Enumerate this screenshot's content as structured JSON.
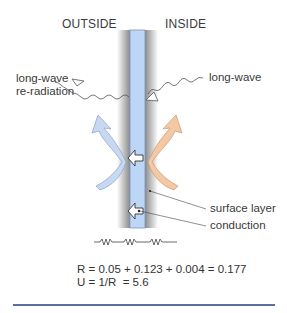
{
  "labels": {
    "outside": "OUTSIDE",
    "inside": "INSIDE",
    "long_wave_left_line1": "long-wave",
    "long_wave_left_line2": "re-radiation",
    "long_wave_right": "long-wave",
    "surface_layer": "surface layer",
    "conduction": "conduction"
  },
  "equations": {
    "resistance": "R = 0.05 + 0.123 + 0.004 = 0.177",
    "u_value": "U = 1/R  = 5.6"
  },
  "colors": {
    "glass": "#bcd6f5",
    "glass_edge": "#7c95b8",
    "frame_gray": "#8a8a8a",
    "cold_arrow": "#c7d8f2",
    "warm_arrow": "#f3c8a2",
    "rule": "#5a6f9c"
  }
}
